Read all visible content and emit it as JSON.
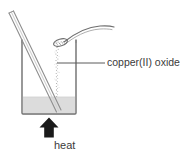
{
  "figure": {
    "type": "science-diagram",
    "background_color": "#ffffff"
  },
  "labels": {
    "oxide": "copper(II) oxide",
    "heat": "heat"
  },
  "colors": {
    "outline": "#6e6e6e",
    "text": "#3b3b3b",
    "liquid": "#dcdcdc",
    "arrow": "#1a1a1a",
    "powder": "#9a9a9a",
    "leader": "#5a5a5a"
  },
  "parts": {
    "beaker": {
      "name": "beaker",
      "left": 22,
      "right": 76,
      "top": 40,
      "bottom": 114,
      "liquid_level": 97
    },
    "stirring_rod": {
      "name": "glass stirring rod",
      "x1": 10,
      "y1": 12,
      "x2": 58,
      "y2": 112
    },
    "spatula": {
      "name": "spatula with copper(II) oxide powder",
      "bowl_cx": 61,
      "bowl_cy": 42
    },
    "powder_stream": {
      "name": "falling copper(II) oxide powder",
      "x": 57,
      "top": 46,
      "bottom": 98
    },
    "heat_arrow": {
      "name": "heat arrow",
      "x": 49,
      "top": 118,
      "bottom": 138
    },
    "leader_line": {
      "name": "label leader line",
      "x1": 57,
      "x2": 105,
      "y": 63
    }
  }
}
